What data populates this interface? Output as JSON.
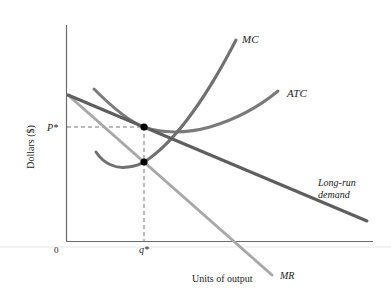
{
  "diagram": {
    "axes": {
      "y_label": "Dollars ($)",
      "x_label": "Units of output",
      "origin_label": "0",
      "price_label": "P*",
      "quantity_label": "q*"
    },
    "curves": {
      "mc": {
        "label": "MC",
        "color": "#707070"
      },
      "atc": {
        "label": "ATC",
        "color": "#7a7a7a"
      },
      "demand": {
        "label_line1": "Long-run",
        "label_line2": "demand",
        "color": "#5e5e5e"
      },
      "mr": {
        "label": "MR",
        "color": "#a8a8a8"
      }
    },
    "points": [
      {
        "name": "price-equilibrium-point",
        "description": "Demand tangent to ATC at P*, q*"
      },
      {
        "name": "mc-mr-intersection-point",
        "description": "MC = MR at q*"
      }
    ],
    "colors": {
      "axis": "#6a6a6a",
      "guide": "#777777",
      "point": "#000000"
    }
  }
}
